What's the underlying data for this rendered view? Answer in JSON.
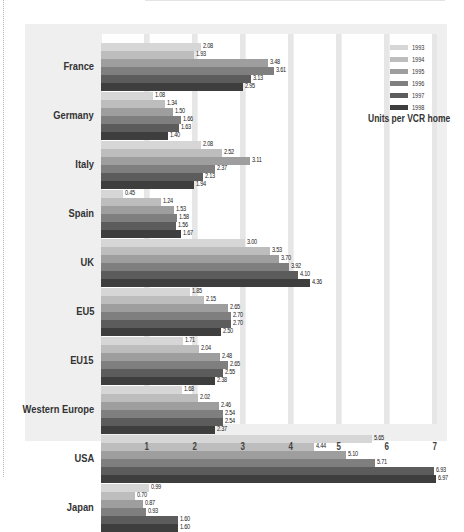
{
  "chart_data": {
    "type": "bar",
    "orientation": "horizontal",
    "title": "",
    "xlabel": "Units per VCR home",
    "ylabel": "",
    "xlim": [
      0,
      7
    ],
    "xticks": [
      "1",
      "2",
      "3",
      "4",
      "5",
      "6",
      "7"
    ],
    "grid": true,
    "legend_position": "top-right",
    "categories": [
      "France",
      "Germany",
      "Italy",
      "Spain",
      "UK",
      "EU5",
      "EU15",
      "Western Europe",
      "USA",
      "Japan"
    ],
    "series": [
      {
        "name": "1993",
        "color": "#d6d6d6",
        "values": [
          2.08,
          1.08,
          2.08,
          0.45,
          3.0,
          1.85,
          1.71,
          1.68,
          5.65,
          0.99
        ]
      },
      {
        "name": "1994",
        "color": "#bdbdbd",
        "values": [
          1.93,
          1.34,
          2.52,
          1.24,
          3.53,
          2.15,
          2.04,
          2.02,
          4.44,
          0.7
        ]
      },
      {
        "name": "1995",
        "color": "#9e9e9e",
        "values": [
          3.48,
          1.5,
          3.11,
          1.53,
          3.7,
          2.65,
          2.48,
          2.46,
          5.1,
          0.87
        ]
      },
      {
        "name": "1996",
        "color": "#7f7f7f",
        "values": [
          3.61,
          1.66,
          2.37,
          1.58,
          3.92,
          2.7,
          2.65,
          2.54,
          5.71,
          0.93
        ]
      },
      {
        "name": "1997",
        "color": "#5c5c5c",
        "values": [
          3.13,
          1.63,
          2.13,
          1.56,
          4.1,
          2.7,
          2.55,
          2.54,
          6.93,
          1.6
        ]
      },
      {
        "name": "1998",
        "color": "#3e3e3e",
        "values": [
          2.95,
          1.4,
          1.94,
          1.67,
          4.36,
          2.5,
          2.38,
          2.37,
          6.97,
          1.6
        ]
      }
    ],
    "value_labels": [
      [
        "2.08",
        "1.93",
        "3.48",
        "3.61",
        "3.13",
        "2.95"
      ],
      [
        "1.08",
        "1.34",
        "1.50",
        "1.66",
        "1.63",
        "1.40"
      ],
      [
        "2.08",
        "2.52",
        "3.11",
        "2.37",
        "2.13",
        "1.94"
      ],
      [
        "0.45",
        "1.24",
        "1.53",
        "1.58",
        "1.56",
        "1.67"
      ],
      [
        "3.00",
        "3.53",
        "3.70",
        "3.92",
        "4.10",
        "4.36"
      ],
      [
        "1.85",
        "2.15",
        "2.65",
        "2.70",
        "2.70",
        "2.50"
      ],
      [
        "1.71",
        "2.04",
        "2.48",
        "2.65",
        "2.55",
        "2.38"
      ],
      [
        "1.68",
        "2.02",
        "2.46",
        "2.54",
        "2.54",
        "2.37"
      ],
      [
        "5.65",
        "4.44",
        "5.10",
        "5.71",
        "6.93",
        "6.97"
      ],
      [
        "0.99",
        "0.70",
        "0.87",
        "0.93",
        "1.60",
        "1.60"
      ]
    ]
  },
  "legend": {
    "items": [
      "1993",
      "1994",
      "1995",
      "1996",
      "1997",
      "1998"
    ],
    "units_label": "Units per VCR home"
  },
  "axis": {
    "ticks": [
      "1",
      "2",
      "3",
      "4",
      "5",
      "6",
      "7"
    ]
  }
}
